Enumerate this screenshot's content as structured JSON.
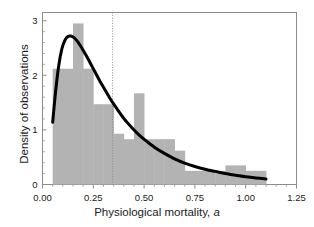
{
  "chart_data": {
    "type": "bar",
    "title": "",
    "xlabel": "Physiological mortality, a",
    "ylabel": "Density of observations",
    "xlim": [
      0.0,
      1.25
    ],
    "ylim": [
      0.0,
      3.15
    ],
    "xticks": [
      0.0,
      0.25,
      0.5,
      0.75,
      1.0,
      1.25
    ],
    "xticklabels": [
      "0.00",
      "0.25",
      "0.50",
      "0.75",
      "1.00",
      "1.25"
    ],
    "yticks": [
      0,
      1,
      2,
      3
    ],
    "yticklabels": [
      "0",
      "1",
      "2",
      "3"
    ],
    "grid": false,
    "legend": null,
    "bar_color": "#b3b3b3",
    "curve_color": "#000000",
    "axis_color": "#8c8c8c",
    "bin_width": 0.05,
    "bin_edges": [
      0.05,
      0.1,
      0.15,
      0.2,
      0.25,
      0.3,
      0.35,
      0.4,
      0.45,
      0.5,
      0.55,
      0.6,
      0.65,
      0.7,
      0.75,
      0.8,
      0.85,
      0.9,
      0.95,
      1.0,
      1.05,
      1.1
    ],
    "categories": [
      "0.05-0.10",
      "0.10-0.15",
      "0.15-0.20",
      "0.20-0.25",
      "0.25-0.30",
      "0.30-0.35",
      "0.35-0.40",
      "0.40-0.45",
      "0.45-0.50",
      "0.50-0.55",
      "0.55-0.60",
      "0.60-0.65",
      "0.65-0.70",
      "0.70-0.75",
      "0.75-0.80",
      "0.80-0.85",
      "0.85-0.90",
      "0.90-0.95",
      "0.95-1.00",
      "1.00-1.05",
      "1.05-1.10"
    ],
    "values": [
      2.12,
      2.12,
      2.95,
      2.12,
      1.47,
      1.47,
      0.93,
      0.83,
      1.67,
      0.83,
      0.83,
      0.83,
      0.62,
      0.25,
      0.25,
      0.25,
      0.25,
      0.35,
      0.35,
      0.25,
      0.25
    ],
    "series": [
      {
        "name": "Density of observations",
        "type": "bar",
        "values": [
          2.12,
          2.12,
          2.95,
          2.12,
          1.47,
          1.47,
          0.93,
          0.83,
          1.67,
          0.83,
          0.83,
          0.83,
          0.62,
          0.25,
          0.25,
          0.25,
          0.25,
          0.35,
          0.35,
          0.25,
          0.25
        ]
      },
      {
        "name": "Fitted density curve",
        "type": "line",
        "x": [
          0.05,
          0.065,
          0.08,
          0.095,
          0.11,
          0.125,
          0.14,
          0.155,
          0.17,
          0.185,
          0.2,
          0.22,
          0.24,
          0.26,
          0.28,
          0.3,
          0.33,
          0.36,
          0.4,
          0.44,
          0.48,
          0.52,
          0.56,
          0.6,
          0.65,
          0.7,
          0.75,
          0.8,
          0.85,
          0.9,
          0.95,
          1.0,
          1.05,
          1.1
        ],
        "y": [
          1.14,
          1.72,
          2.18,
          2.48,
          2.64,
          2.71,
          2.72,
          2.69,
          2.63,
          2.55,
          2.46,
          2.33,
          2.19,
          2.05,
          1.91,
          1.78,
          1.59,
          1.42,
          1.21,
          1.04,
          0.89,
          0.77,
          0.66,
          0.57,
          0.47,
          0.39,
          0.33,
          0.28,
          0.24,
          0.2,
          0.17,
          0.14,
          0.12,
          0.1
        ]
      }
    ],
    "annotations": [
      {
        "name": "mean-reference-line",
        "type": "vline",
        "x": 0.345,
        "style": "dotted",
        "color": "#8c8c8c"
      }
    ]
  }
}
